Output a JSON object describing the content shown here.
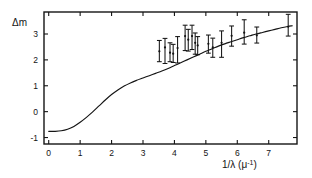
{
  "figure": {
    "background": "#ffffff",
    "ink": "#141414"
  },
  "axes": {
    "ylabel": "Δm",
    "xlabel_parts": {
      "main": "1/λ",
      "unit_open": "(μ",
      "unit_exp": "-1",
      "unit_close": ")"
    },
    "xlabel": "1/λ (μ-1)",
    "x_ticks": [
      "0",
      "1",
      "2",
      "3",
      "4",
      "5",
      "6",
      "7"
    ],
    "y_ticks": [
      "3",
      "2",
      "1",
      "0",
      "-1"
    ]
  },
  "chart_data": {
    "type": "line",
    "title": "",
    "subtitle": "",
    "xlabel": "1/λ (μ⁻¹)",
    "ylabel": "Δm",
    "xlim": [
      -0.15,
      7.9
    ],
    "ylim": [
      -1.25,
      3.85
    ],
    "x_ticks": [
      0,
      1,
      2,
      3,
      4,
      5,
      6,
      7
    ],
    "y_ticks": [
      -1,
      0,
      1,
      2,
      3
    ],
    "grid": false,
    "legend": null,
    "series": [
      {
        "name": "model curve",
        "type": "line",
        "color": "#141414",
        "x": [
          0.0,
          0.2,
          0.4,
          0.6,
          0.8,
          1.0,
          1.2,
          1.4,
          1.6,
          1.8,
          2.0,
          2.2,
          2.4,
          2.6,
          2.8,
          3.0,
          3.2,
          3.4,
          3.6,
          3.8,
          4.0,
          4.2,
          4.4,
          4.6,
          4.8,
          5.0,
          5.2,
          5.4,
          5.6,
          5.8,
          6.0,
          6.2,
          6.4,
          6.6,
          6.8,
          7.0,
          7.2,
          7.4,
          7.6,
          7.75
        ],
        "y": [
          -0.76,
          -0.76,
          -0.74,
          -0.68,
          -0.57,
          -0.41,
          -0.22,
          -0.01,
          0.22,
          0.45,
          0.66,
          0.84,
          0.99,
          1.11,
          1.21,
          1.3,
          1.39,
          1.48,
          1.57,
          1.67,
          1.78,
          1.89,
          2.0,
          2.11,
          2.22,
          2.33,
          2.43,
          2.53,
          2.62,
          2.7,
          2.78,
          2.86,
          2.93,
          3.0,
          3.06,
          3.12,
          3.18,
          3.24,
          3.29,
          3.32
        ]
      },
      {
        "name": "observations",
        "type": "errorbar",
        "color": "#141414",
        "points": [
          {
            "x": 3.52,
            "y": 2.33,
            "yerr_low": 0.4,
            "yerr_high": 0.42
          },
          {
            "x": 3.7,
            "y": 2.48,
            "yerr_low": 0.62,
            "yerr_high": 0.35
          },
          {
            "x": 3.86,
            "y": 2.28,
            "yerr_low": 0.35,
            "yerr_high": 0.38
          },
          {
            "x": 3.96,
            "y": 2.24,
            "yerr_low": 0.34,
            "yerr_high": 0.36
          },
          {
            "x": 4.1,
            "y": 2.46,
            "yerr_low": 0.58,
            "yerr_high": 0.44
          },
          {
            "x": 4.34,
            "y": 2.92,
            "yerr_low": 0.56,
            "yerr_high": 0.42
          },
          {
            "x": 4.44,
            "y": 2.78,
            "yerr_low": 0.44,
            "yerr_high": 0.4
          },
          {
            "x": 4.56,
            "y": 2.92,
            "yerr_low": 0.52,
            "yerr_high": 0.42
          },
          {
            "x": 4.66,
            "y": 2.66,
            "yerr_low": 0.44,
            "yerr_high": 0.38
          },
          {
            "x": 4.74,
            "y": 2.56,
            "yerr_low": 0.36,
            "yerr_high": 0.34
          },
          {
            "x": 5.08,
            "y": 2.62,
            "yerr_low": 0.36,
            "yerr_high": 0.34
          },
          {
            "x": 5.22,
            "y": 2.48,
            "yerr_low": 0.38,
            "yerr_high": 0.36
          },
          {
            "x": 5.5,
            "y": 2.66,
            "yerr_low": 0.56,
            "yerr_high": 0.46
          },
          {
            "x": 5.82,
            "y": 2.93,
            "yerr_low": 0.4,
            "yerr_high": 0.38
          },
          {
            "x": 6.22,
            "y": 3.05,
            "yerr_low": 0.44,
            "yerr_high": 0.5
          },
          {
            "x": 6.62,
            "y": 2.95,
            "yerr_low": 0.3,
            "yerr_high": 0.32
          },
          {
            "x": 7.62,
            "y": 3.28,
            "yerr_low": 0.36,
            "yerr_high": 0.48
          }
        ]
      }
    ]
  }
}
